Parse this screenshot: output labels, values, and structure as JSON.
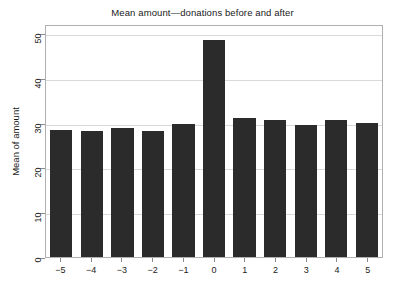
{
  "chart_data": {
    "type": "bar",
    "title": "Mean amount—donations before and after",
    "xlabel": "",
    "ylabel": "Mean of amount",
    "categories": [
      "−5",
      "−4",
      "−3",
      "−2",
      "−1",
      "0",
      "1",
      "2",
      "3",
      "4",
      "5"
    ],
    "values": [
      28.4,
      28.2,
      28.7,
      28.1,
      29.7,
      48.4,
      31.1,
      30.5,
      29.5,
      30.6,
      29.8
    ],
    "ylim": [
      0,
      52
    ],
    "yticks": [
      0,
      10,
      20,
      30,
      40,
      50
    ],
    "ytick_labels": [
      "0",
      "10",
      "20",
      "30",
      "40",
      "50"
    ],
    "grid": true,
    "gridlines_at": [
      10,
      20,
      30,
      40,
      50
    ],
    "legend": null,
    "bar_color": "#2b2b2b",
    "grid_color": "#d9d9d9",
    "frame_color": "#b0b0b0",
    "background_color": "#ffffff"
  }
}
